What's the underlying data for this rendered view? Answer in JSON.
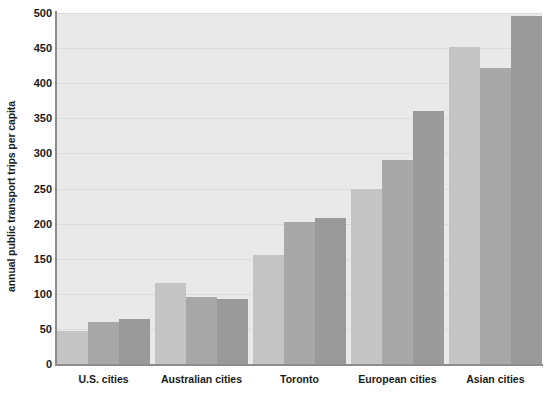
{
  "chart_data": {
    "type": "bar",
    "title": "",
    "subtitle": "",
    "xlabel": "",
    "ylabel": "annual public transport trips per capita",
    "ylim": [
      0,
      500
    ],
    "ytick_step": 50,
    "ytick_labels": [
      "500",
      "450",
      "400",
      "350",
      "300",
      "250",
      "200",
      "150",
      "100",
      "50",
      "0"
    ],
    "ytick_values": [
      500,
      450,
      400,
      350,
      300,
      250,
      200,
      150,
      100,
      50,
      0
    ],
    "grid": true,
    "grid_axis": "y",
    "legend": false,
    "legend_position": "none",
    "categories": [
      "U.S. cities",
      "Australian cities",
      "Toronto",
      "European cities",
      "Asian cities"
    ],
    "series": [
      {
        "name": "bar-1",
        "color": "#c4c4c4",
        "values": [
          47,
          116,
          155,
          250,
          452
        ]
      },
      {
        "name": "bar-2",
        "color": "#a8a8a8",
        "values": [
          60,
          95,
          203,
          290,
          422
        ]
      },
      {
        "name": "bar-3",
        "color": "#9a9a9a",
        "values": [
          64,
          93,
          208,
          360,
          496
        ]
      }
    ],
    "groups": [
      {
        "label": "U.S. cities",
        "values": [
          47,
          60,
          64
        ]
      },
      {
        "label": "Australian cities",
        "values": [
          116,
          95,
          93
        ]
      },
      {
        "label": "Toronto",
        "values": [
          155,
          203,
          208
        ]
      },
      {
        "label": "European cities",
        "values": [
          250,
          290,
          360
        ]
      },
      {
        "label": "Asian cities",
        "values": [
          452,
          422,
          496
        ]
      }
    ],
    "plot_background": "#e9e9e9",
    "axis_color": "#8c8c8c",
    "gridline_color": "#dcdcdc",
    "text_color": "#1a1a1a"
  }
}
